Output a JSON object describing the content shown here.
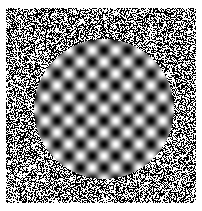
{
  "figure": {
    "name": "circular-plaid-grating-in-binary-noise",
    "width": 202,
    "height": 211,
    "background_color": "#ffffff"
  },
  "noise_field": {
    "name": "binary-salt-and-pepper-noise",
    "x": 6,
    "y": 8,
    "width": 190,
    "height": 195,
    "black_color": "#000000",
    "white_color": "#ffffff",
    "black_fraction": 0.5,
    "pixel_size": 1,
    "seed": 20240517
  },
  "grating_disc": {
    "name": "sinusoidal-plaid-disc",
    "center_x": 104,
    "center_y": 109,
    "radius": 70,
    "diameter": 140,
    "period_px": 23.5,
    "orientation_deg": 0,
    "phase_x_deg": 0,
    "phase_y_deg": 0,
    "contrast": 1.0,
    "mean_luminance": 0.5,
    "min_color": "#000000",
    "max_color": "#ffffff",
    "blob_columns": 6,
    "blob_rows": 6,
    "pattern": "plaid"
  },
  "margins": {
    "left": 6,
    "top": 8,
    "right": 6,
    "bottom": 8
  }
}
